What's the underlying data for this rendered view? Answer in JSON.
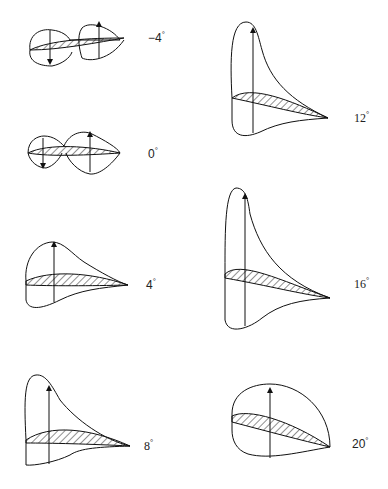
{
  "panels": [
    {
      "angle": "−4",
      "unit": "°"
    },
    {
      "angle": "0",
      "unit": "°"
    },
    {
      "angle": "4",
      "unit": "°"
    },
    {
      "angle": "8",
      "unit": "°"
    },
    {
      "angle": "12",
      "unit": "°"
    },
    {
      "angle": "16",
      "unit": "°"
    },
    {
      "angle": "20",
      "unit": "°"
    }
  ]
}
